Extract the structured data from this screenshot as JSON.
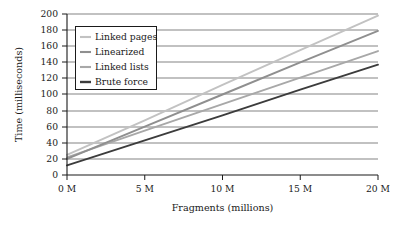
{
  "chart_data": {
    "type": "line",
    "title": "",
    "xlabel": "Fragments (millions)",
    "ylabel": "Time (milliseconds)",
    "xlim": [
      0,
      20
    ],
    "ylim": [
      0,
      200
    ],
    "x": [
      0,
      5,
      10,
      15,
      20
    ],
    "xticklabels": [
      "0 M",
      "5 M",
      "10 M",
      "15 M",
      "20 M"
    ],
    "yticks": [
      0,
      20,
      40,
      60,
      80,
      100,
      120,
      140,
      160,
      180,
      200
    ],
    "yticklabels": [
      "0",
      "20",
      "40",
      "60",
      "80",
      "100",
      "120",
      "140",
      "160",
      "180",
      "200"
    ],
    "grid": "horizontal",
    "legend_position": "upper-left-inside",
    "series": [
      {
        "name": "Linked pages",
        "color": "#c2c2c2",
        "values": [
          25,
          68,
          112,
          155,
          198
        ]
      },
      {
        "name": "Linearized",
        "color": "#8f8f8f",
        "values": [
          20,
          60,
          100,
          140,
          179
        ]
      },
      {
        "name": "Linked lists",
        "color": "#a8a8a8",
        "values": [
          22,
          55,
          88,
          121,
          154
        ]
      },
      {
        "name": "Brute force",
        "color": "#3c3c3c",
        "values": [
          12,
          43,
          74,
          106,
          137
        ]
      }
    ]
  },
  "axes": {
    "y_title": "Time (milliseconds)",
    "x_title": "Fragments (millions)",
    "y_tick_0": "0",
    "y_tick_20": "20",
    "y_tick_40": "40",
    "y_tick_60": "60",
    "y_tick_80": "80",
    "y_tick_100": "100",
    "y_tick_120": "120",
    "y_tick_140": "140",
    "y_tick_160": "160",
    "y_tick_180": "180",
    "y_tick_200": "200",
    "x_tick_0": "0 M",
    "x_tick_5": "5 M",
    "x_tick_10": "10 M",
    "x_tick_15": "15 M",
    "x_tick_20": "20 M"
  },
  "legend": {
    "entry_0": "Linked pages",
    "entry_1": "Linearized",
    "entry_2": "Linked lists",
    "entry_3": "Brute force"
  },
  "colors": {
    "axis": "#1a1a1a",
    "grid": "#4d4d4d",
    "background": "#ffffff",
    "linked_pages": "#c2c2c2",
    "linearized": "#8f8f8f",
    "linked_lists": "#a8a8a8",
    "brute_force": "#3c3c3c"
  }
}
